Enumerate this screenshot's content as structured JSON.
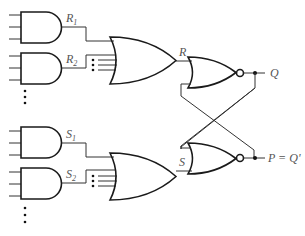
{
  "diagram": {
    "labels": {
      "r1": "R",
      "r1_sub": "1",
      "r2": "R",
      "r2_sub": "2",
      "s1": "S",
      "s1_sub": "1",
      "s2": "S",
      "s2_sub": "2",
      "r": "R",
      "s": "S",
      "q": "Q",
      "p": "P = Q'"
    },
    "gates": [
      {
        "id": "and-r1",
        "type": "AND",
        "inputs": 3,
        "output": "R1"
      },
      {
        "id": "and-r2",
        "type": "AND",
        "inputs": 3,
        "output": "R2"
      },
      {
        "id": "or-r",
        "type": "OR",
        "inputs": "R1, R2, ...",
        "output": "R"
      },
      {
        "id": "nor-q",
        "type": "NOR",
        "inputs": "R, P",
        "output": "Q"
      },
      {
        "id": "and-s1",
        "type": "AND",
        "inputs": 3,
        "output": "S1"
      },
      {
        "id": "and-s2",
        "type": "AND",
        "inputs": 3,
        "output": "S2"
      },
      {
        "id": "or-s",
        "type": "OR",
        "inputs": "S1, S2, ...",
        "output": "S"
      },
      {
        "id": "nor-p",
        "type": "NOR",
        "inputs": "S, Q",
        "output": "P = Q'"
      }
    ]
  }
}
